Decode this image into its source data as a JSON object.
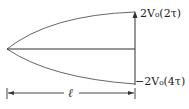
{
  "diagram": {
    "labels": {
      "top_label": "2V₀(2τ)",
      "bottom_label": "−2V₀(4τ)",
      "length_label": "ℓ"
    },
    "colors": {
      "stroke": "#444444",
      "axis": "#333333"
    }
  }
}
